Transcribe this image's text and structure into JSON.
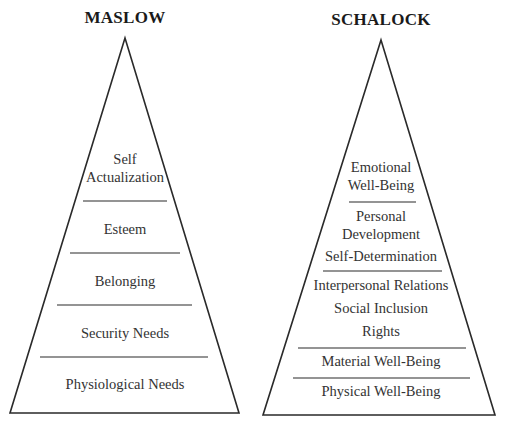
{
  "colors": {
    "stroke": "#2a2a2a",
    "text": "#333333",
    "background": "#ffffff"
  },
  "pyramids": [
    {
      "title": "MASLOW",
      "levels_top_to_bottom": [
        "Self Actualization",
        "Esteem",
        "Belonging",
        "Security Needs",
        "Physiological Needs"
      ],
      "labels": {
        "self_1": "Self",
        "self_2": "Actualization",
        "esteem": "Esteem",
        "belonging": "Belonging",
        "security": "Security Needs",
        "physiological": "Physiological Needs"
      }
    },
    {
      "title": "SCHALOCK",
      "levels_top_to_bottom": [
        [
          "Emotional Well-Being"
        ],
        [
          "Personal Development",
          "Self-Determination"
        ],
        [
          "Interpersonal Relations",
          "Social Inclusion",
          "Rights"
        ],
        [
          "Material Well-Being"
        ],
        [
          "Physical Well-Being"
        ]
      ],
      "labels": {
        "emotional_1": "Emotional",
        "emotional_2": "Well-Being",
        "personal_1": "Personal",
        "personal_2": "Development",
        "selfdet": "Self-Determination",
        "interpersonal": "Interpersonal Relations",
        "social": "Social Inclusion",
        "rights": "Rights",
        "material": "Material Well-Being",
        "physical": "Physical Well-Being"
      }
    }
  ]
}
